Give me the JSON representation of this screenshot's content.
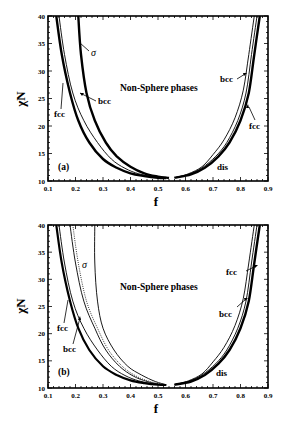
{
  "chart_data": [
    {
      "type": "line",
      "panel_label": "(a)",
      "title": "",
      "xlabel": "f",
      "ylabel": "χN",
      "xlim": [
        0.1,
        0.9
      ],
      "ylim": [
        10,
        40
      ],
      "xticks": [
        "0.1",
        "0.2",
        "0.3",
        "0.4",
        "0.5",
        "0.6",
        "0.7",
        "0.8",
        "0.9"
      ],
      "yticks": [
        "10",
        "15",
        "20",
        "25",
        "30",
        "35",
        "40"
      ],
      "grid": false,
      "annotations": [
        "Non-Sphere phases",
        "σ",
        "bcc",
        "fcc",
        "bcc",
        "fcc",
        "dis"
      ],
      "series": [
        {
          "name": "fcc (left, thick)",
          "x": [
            0.13,
            0.15,
            0.18,
            0.21,
            0.25,
            0.3,
            0.35,
            0.4,
            0.45,
            0.5,
            0.53
          ],
          "y": [
            40,
            33,
            26,
            21,
            17,
            14,
            12.4,
            11.4,
            10.9,
            10.6,
            10.55
          ]
        },
        {
          "name": "dis (left, thin)",
          "x": [
            0.14,
            0.16,
            0.19,
            0.23,
            0.28,
            0.33,
            0.38,
            0.43,
            0.48,
            0.52
          ],
          "y": [
            40,
            33,
            26,
            21,
            17,
            14,
            12.3,
            11.3,
            10.8,
            10.55
          ]
        },
        {
          "name": "bcc/σ (left, thick)",
          "x": [
            0.21,
            0.22,
            0.24,
            0.27,
            0.31,
            0.35,
            0.4,
            0.45,
            0.5,
            0.54
          ],
          "y": [
            40,
            33,
            26,
            21,
            17,
            14.5,
            12.6,
            11.4,
            10.8,
            10.55
          ]
        },
        {
          "name": "fcc (right, thick)",
          "x": [
            0.56,
            0.62,
            0.67,
            0.72,
            0.76,
            0.8,
            0.83,
            0.85,
            0.87
          ],
          "y": [
            10.6,
            11.2,
            12.4,
            14.5,
            17,
            21,
            26,
            33,
            40
          ]
        },
        {
          "name": "dis (right, thin)",
          "x": [
            0.56,
            0.61,
            0.66,
            0.71,
            0.75,
            0.79,
            0.82,
            0.84,
            0.86
          ],
          "y": [
            10.6,
            11.2,
            12.4,
            14.5,
            17,
            21,
            26,
            33,
            40
          ]
        },
        {
          "name": "bcc (right, thin)",
          "x": [
            0.56,
            0.61,
            0.66,
            0.7,
            0.74,
            0.78,
            0.81,
            0.83,
            0.85
          ],
          "y": [
            10.6,
            11.3,
            12.6,
            14.8,
            17.5,
            21.5,
            26.5,
            33,
            40
          ]
        }
      ]
    },
    {
      "type": "line",
      "panel_label": "(b)",
      "title": "",
      "xlabel": "f",
      "ylabel": "χN",
      "xlim": [
        0.1,
        0.9
      ],
      "ylim": [
        10,
        40
      ],
      "xticks": [
        "0.1",
        "0.2",
        "0.3",
        "0.4",
        "0.5",
        "0.6",
        "0.7",
        "0.8",
        "0.9"
      ],
      "yticks": [
        "10",
        "15",
        "20",
        "25",
        "30",
        "35",
        "40"
      ],
      "grid": false,
      "annotations": [
        "Non-Sphere phases",
        "σ",
        "fcc",
        "bcc",
        "fcc",
        "bcc",
        "dis"
      ],
      "series": [
        {
          "name": "fcc (left, thick)",
          "x": [
            0.13,
            0.15,
            0.18,
            0.21,
            0.25,
            0.3,
            0.35,
            0.4,
            0.45,
            0.5,
            0.53
          ],
          "y": [
            40,
            33,
            26,
            21,
            17,
            14,
            12.4,
            11.4,
            10.9,
            10.6,
            10.55
          ]
        },
        {
          "name": "bcc (left, thin)",
          "x": [
            0.14,
            0.16,
            0.19,
            0.23,
            0.28,
            0.33,
            0.38,
            0.43,
            0.48,
            0.52
          ],
          "y": [
            40,
            33,
            26,
            21,
            17,
            14,
            12.3,
            11.3,
            10.8,
            10.55
          ]
        },
        {
          "name": "dis (left, thin)",
          "x": [
            0.18,
            0.2,
            0.23,
            0.27,
            0.31,
            0.36,
            0.41,
            0.46,
            0.51
          ],
          "y": [
            40,
            33,
            26,
            21,
            17,
            14,
            12.2,
            11.2,
            10.6
          ]
        },
        {
          "name": "σ boundary (dotted)",
          "x": [
            0.19,
            0.21,
            0.24,
            0.28,
            0.32,
            0.37,
            0.42,
            0.47,
            0.52
          ],
          "y": [
            40,
            33,
            26,
            21,
            17,
            14,
            12.2,
            11.2,
            10.6
          ]
        },
        {
          "name": "σ / Non-Sphere (thin)",
          "x": [
            0.27,
            0.27,
            0.28,
            0.3,
            0.34,
            0.39,
            0.44,
            0.49,
            0.53
          ],
          "y": [
            40,
            33,
            26,
            21,
            17,
            14,
            12.4,
            11.2,
            10.6
          ]
        },
        {
          "name": "fcc (right, thick)",
          "x": [
            0.56,
            0.62,
            0.67,
            0.72,
            0.76,
            0.8,
            0.83,
            0.85,
            0.87
          ],
          "y": [
            10.6,
            11.2,
            12.4,
            14.5,
            17,
            21,
            26,
            33,
            40
          ]
        },
        {
          "name": "bcc (right, thin)",
          "x": [
            0.56,
            0.61,
            0.66,
            0.71,
            0.75,
            0.79,
            0.82,
            0.84,
            0.86
          ],
          "y": [
            10.6,
            11.2,
            12.4,
            14.5,
            17,
            21,
            26,
            33,
            40
          ]
        },
        {
          "name": "dis (right, thin)",
          "x": [
            0.56,
            0.61,
            0.66,
            0.7,
            0.74,
            0.78,
            0.81,
            0.83,
            0.85
          ],
          "y": [
            10.6,
            11.3,
            12.6,
            14.8,
            17.5,
            21.5,
            26.5,
            33,
            40
          ]
        }
      ]
    }
  ],
  "panels": [
    {
      "label": "(a)",
      "region_label": "Non-Sphere phases",
      "xlabel": "f",
      "ylabel": "χN",
      "left": {
        "sigma": "σ",
        "bcc": "bcc",
        "fcc": "fcc"
      },
      "right": {
        "bcc": "bcc",
        "fcc": "fcc",
        "dis": "dis"
      }
    },
    {
      "label": "(b)",
      "region_label": "Non-Sphere phases",
      "xlabel": "f",
      "ylabel": "χN",
      "left": {
        "sigma": "σ",
        "fcc": "fcc",
        "bcc": "bcc"
      },
      "right": {
        "fcc": "fcc",
        "bcc": "bcc",
        "dis": "dis"
      }
    }
  ],
  "xticks": [
    "0.1",
    "0.2",
    "0.3",
    "0.4",
    "0.5",
    "0.6",
    "0.7",
    "0.8",
    "0.9"
  ],
  "yticks": [
    "40",
    "35",
    "30",
    "25",
    "20",
    "15",
    "10"
  ]
}
